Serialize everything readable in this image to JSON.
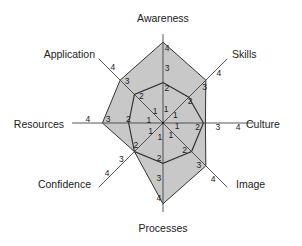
{
  "chart_data": {
    "type": "radar",
    "title": "",
    "axes": [
      "Awareness",
      "Skills",
      "Culture",
      "Image",
      "Processes",
      "Confidence",
      "Resources",
      "Application"
    ],
    "scale": {
      "min": 0,
      "max": 4,
      "ticks": [
        1,
        2,
        3,
        4
      ]
    },
    "series": [
      {
        "name": "Outer (shaded)",
        "values": [
          4,
          3,
          2.1,
          3,
          4,
          2,
          3,
          3
        ]
      },
      {
        "name": "Inner",
        "values": [
          2,
          1.8,
          2,
          2,
          2,
          2,
          1.7,
          2
        ]
      }
    ],
    "colors": {
      "fill": "#c8c8c8",
      "stroke": "#333333",
      "axis": "#555555"
    },
    "grid": false,
    "legend": null
  }
}
